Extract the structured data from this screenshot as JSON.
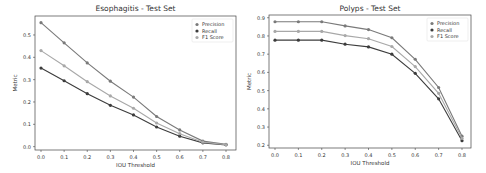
{
  "chart_data": [
    {
      "type": "line",
      "title": "Esophagitis - Test Set",
      "xlabel": "IOU Threshold",
      "ylabel": "Metric",
      "x": [
        0.0,
        0.1,
        0.2,
        0.3,
        0.4,
        0.5,
        0.6,
        0.7,
        0.8
      ],
      "xticks": [
        "0.0",
        "0.1",
        "0.2",
        "0.3",
        "0.4",
        "0.5",
        "0.6",
        "0.7",
        "0.8"
      ],
      "yticks": [
        "0.0",
        "0.1",
        "0.2",
        "0.3",
        "0.4",
        "0.5"
      ],
      "ylim": [
        -0.015,
        0.585
      ],
      "grid": false,
      "legend_position": "upper right",
      "series": [
        {
          "name": "Precision",
          "color": "#7a7a7a",
          "values": [
            0.555,
            0.465,
            0.375,
            0.293,
            0.222,
            0.135,
            0.075,
            0.025,
            0.01
          ]
        },
        {
          "name": "Recall",
          "color": "#3c3c3c",
          "values": [
            0.352,
            0.295,
            0.237,
            0.185,
            0.142,
            0.088,
            0.047,
            0.017,
            0.008
          ]
        },
        {
          "name": "F1 Score",
          "color": "#a8a8a8",
          "values": [
            0.43,
            0.362,
            0.291,
            0.227,
            0.172,
            0.106,
            0.058,
            0.02,
            0.009
          ]
        }
      ]
    },
    {
      "type": "line",
      "title": "Polyps - Test Set",
      "xlabel": "IOU Threshold",
      "ylabel": "Metric",
      "x": [
        0.0,
        0.1,
        0.2,
        0.3,
        0.4,
        0.5,
        0.6,
        0.7,
        0.8
      ],
      "xticks": [
        "0.0",
        "0.1",
        "0.2",
        "0.3",
        "0.4",
        "0.5",
        "0.6",
        "0.7",
        "0.8"
      ],
      "yticks": [
        "0.2",
        "0.3",
        "0.4",
        "0.5",
        "0.6",
        "0.7",
        "0.8",
        "0.9"
      ],
      "ylim": [
        0.185,
        0.915
      ],
      "grid": false,
      "legend_position": "upper right",
      "series": [
        {
          "name": "Precision",
          "color": "#7a7a7a",
          "values": [
            0.878,
            0.878,
            0.878,
            0.855,
            0.835,
            0.79,
            0.672,
            0.517,
            0.25
          ]
        },
        {
          "name": "Recall",
          "color": "#3c3c3c",
          "values": [
            0.777,
            0.777,
            0.777,
            0.755,
            0.74,
            0.7,
            0.595,
            0.455,
            0.225
          ]
        },
        {
          "name": "F1 Score",
          "color": "#a8a8a8",
          "values": [
            0.825,
            0.825,
            0.825,
            0.802,
            0.785,
            0.742,
            0.632,
            0.485,
            0.238
          ]
        }
      ]
    }
  ]
}
